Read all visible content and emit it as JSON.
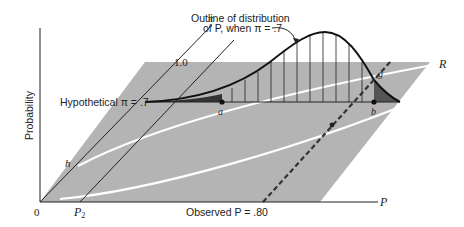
{
  "diagram": {
    "y_axis_label": "Probability",
    "x_axis_label": "P",
    "origin_label": "0",
    "pi_axis_label": "π",
    "pi_axis_tick": "1.0",
    "hypothetical_label": "Hypothetical π = .7",
    "observed_label": "Observed P = .80",
    "annotation_line1": "Outline of distribution",
    "annotation_line2": "of P, when π = .7",
    "point_a": "a",
    "point_b": "b",
    "point_g": "g",
    "region_R": "R",
    "curve_h": "h",
    "p2_label": "P",
    "p2_sub": "2",
    "colors": {
      "plane": "#b4b4b4",
      "line": "#222222",
      "white_curve": "#ffffff",
      "tail_fill": "#555555"
    }
  }
}
